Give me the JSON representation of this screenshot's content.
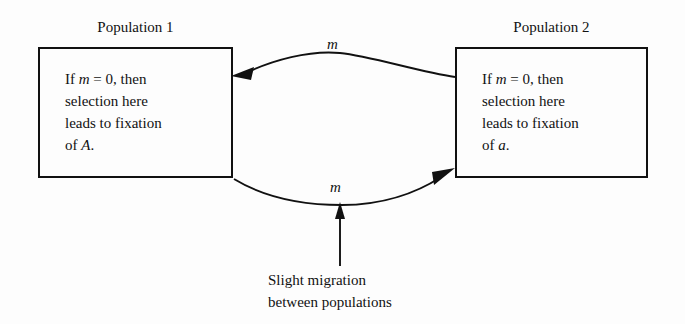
{
  "diagram": {
    "title_left": "Population 1",
    "title_right": "Population 2",
    "box_left_text": "If m = 0, then\nselection here\nleads to fixation\nof A.",
    "box_right_text": "If m = 0, then\nselection here\nleads to fixation\nof a.",
    "migration_label_top": "m",
    "migration_label_bottom": "m",
    "caption": "Slight migration\nbetween populations",
    "colors": {
      "background": "#fdfdfd",
      "ink": "#111111",
      "box_border": "#111111"
    }
  }
}
